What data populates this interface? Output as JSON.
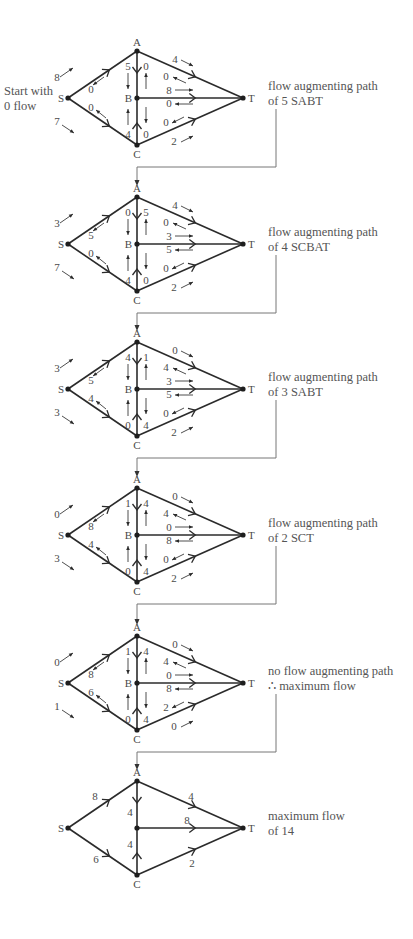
{
  "intro_label": [
    "Start with",
    "0 flow"
  ],
  "node_labels": {
    "S": "S",
    "A": "A",
    "B": "B",
    "C": "C",
    "T": "T"
  },
  "stages": [
    {
      "caption": [
        "flow augmenting path",
        "of 5 SABT"
      ],
      "SA": [
        "8",
        "0"
      ],
      "SC": [
        "0",
        "7"
      ],
      "AB": [
        "5",
        "0"
      ],
      "CB": [
        "4",
        "0"
      ],
      "AT": [
        "4",
        "0"
      ],
      "BT": [
        "8",
        "0"
      ],
      "CT": [
        "0",
        "2"
      ]
    },
    {
      "caption": [
        "flow augmenting path",
        "of 4 SCBAT"
      ],
      "SA": [
        "3",
        "5"
      ],
      "SC": [
        "0",
        "7"
      ],
      "AB": [
        "0",
        "5"
      ],
      "CB": [
        "4",
        "0"
      ],
      "AT": [
        "4",
        "0"
      ],
      "BT": [
        "3",
        "5"
      ],
      "CT": [
        "0",
        "2"
      ]
    },
    {
      "caption": [
        "flow augmenting path",
        "of 3 SABT"
      ],
      "SA": [
        "3",
        "5"
      ],
      "SC": [
        "4",
        "3"
      ],
      "AB": [
        "4",
        "1"
      ],
      "CB": [
        "0",
        "4"
      ],
      "AT": [
        "0",
        "4"
      ],
      "BT": [
        "3",
        "5"
      ],
      "CT": [
        "0",
        "2"
      ]
    },
    {
      "caption": [
        "flow augmenting path",
        "of 2 SCT"
      ],
      "SA": [
        "0",
        "8"
      ],
      "SC": [
        "4",
        "3"
      ],
      "AB": [
        "1",
        "4"
      ],
      "CB": [
        "0",
        "4"
      ],
      "AT": [
        "0",
        "4"
      ],
      "BT": [
        "0",
        "8"
      ],
      "CT": [
        "0",
        "2"
      ]
    },
    {
      "caption": [
        "no flow augmenting path",
        "∴ maximum flow"
      ],
      "SA": [
        "0",
        "8"
      ],
      "SC": [
        "6",
        "1"
      ],
      "AB": [
        "1",
        "4"
      ],
      "CB": [
        "0",
        "4"
      ],
      "AT": [
        "0",
        "4"
      ],
      "BT": [
        "0",
        "8"
      ],
      "CT": [
        "2",
        "0"
      ]
    }
  ],
  "final": {
    "caption": [
      "maximum flow",
      "of 14"
    ],
    "flows": {
      "SA": "8",
      "SC": "6",
      "AB": "4",
      "CB": "4",
      "AT": "4",
      "BT": "8",
      "CT": "2"
    },
    "show_B_label": false
  }
}
